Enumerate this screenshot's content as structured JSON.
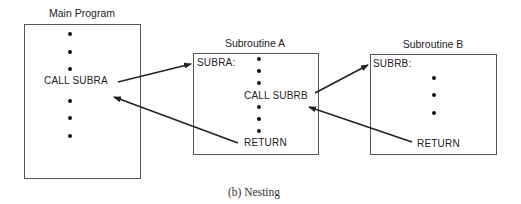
{
  "diagram": {
    "caption": "(b) Nesting",
    "blocks": {
      "main": {
        "title": "Main Program",
        "call": "CALL SUBRA"
      },
      "sub_a": {
        "title": "Subroutine A",
        "label": "SUBRA:",
        "call": "CALL SUBRB",
        "return": "RETURN"
      },
      "sub_b": {
        "title": "Subroutine B",
        "label": "SUBRB:",
        "return": "RETURN"
      }
    },
    "arrows": [
      {
        "from": "CALL SUBRA",
        "to": "SUBRA:",
        "meaning": "call"
      },
      {
        "from": "RETURN (Subroutine A)",
        "to": "CALL SUBRA",
        "meaning": "return"
      },
      {
        "from": "CALL SUBRB",
        "to": "SUBRB:",
        "meaning": "call"
      },
      {
        "from": "RETURN (Subroutine B)",
        "to": "CALL SUBRB",
        "meaning": "return"
      }
    ],
    "colors": {
      "line": "#222222",
      "box_border": "#555555"
    }
  }
}
